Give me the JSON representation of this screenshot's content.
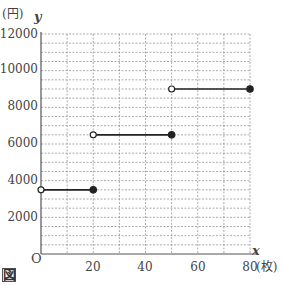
{
  "chart_data": {
    "type": "line",
    "subtype": "step",
    "title": "",
    "xlabel": "x",
    "ylabel": "y",
    "x_unit": "(枚)",
    "y_unit": "(円)",
    "origin_label": "O",
    "figure_label": "図",
    "xlim": [
      0,
      80
    ],
    "ylim": [
      0,
      12000
    ],
    "x_ticks": [
      20,
      40,
      60,
      80
    ],
    "y_ticks": [
      2000,
      4000,
      6000,
      8000,
      10000,
      12000
    ],
    "x_grid_step": 10,
    "y_grid_step": 500,
    "grid": true,
    "grid_style": "dotted",
    "series": [
      {
        "name": "cost",
        "segments": [
          {
            "x_start": 0,
            "x_end": 20,
            "y": 3500,
            "start_open": true,
            "end_closed": true
          },
          {
            "x_start": 20,
            "x_end": 50,
            "y": 6500,
            "start_open": true,
            "end_closed": true
          },
          {
            "x_start": 50,
            "x_end": 80,
            "y": 9000,
            "start_open": true,
            "end_closed": true
          }
        ]
      }
    ]
  },
  "labels": {
    "y_unit": "(円)",
    "y_axis": "y",
    "x_axis": "x",
    "x_unit": "(枚)",
    "origin": "O",
    "figure": "図",
    "y_ticks": [
      "12000",
      "10000",
      "8000",
      "6000",
      "4000",
      "2000"
    ],
    "x_ticks": [
      "20",
      "40",
      "60",
      "80"
    ]
  },
  "colors": {
    "line": "#222222",
    "grid": "#888888",
    "axis": "#555555"
  }
}
